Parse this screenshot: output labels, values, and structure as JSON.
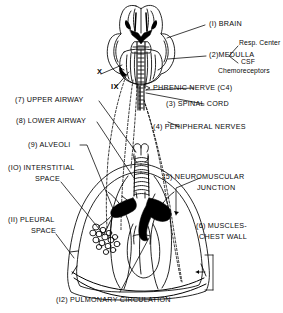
{
  "figure": {
    "ink_color": "#000000",
    "paper_color": "#ffffff"
  },
  "labels": {
    "brain": "(I) BRAIN",
    "medulla": "(2)MEDULLA",
    "resp_center": "Resp. Center",
    "csf_chemoreceptors_l1": "CSF",
    "csf_chemoreceptors_l2": "Chemoreceptors",
    "phrenic_nerve": "PHRENIC NERVE (C4)",
    "spinal_cord": "(3) SPINAL CORD",
    "peripheral_nerves": "(4) PERIPHERAL NERVES",
    "neuromuscular_l1": "(5) NEUROMUSCULAR",
    "neuromuscular_l2": "JUNCTION",
    "muscles_l1": "(6) MUSCLES-",
    "muscles_l2": "CHEST WALL",
    "upper_airway": "(7) UPPER AIRWAY",
    "lower_airway": "(8) LOWER AIRWAY",
    "alveoli": "(9) ALVEOLI",
    "interstitial_l1": "(IO) INTERSTITIAL",
    "interstitial_l2": "SPACE",
    "pleural_l1": "(II) PLEURAL",
    "pleural_l2": "SPACE",
    "pulmonary_circulation": "(I2) PULMONARY CIRCULATION",
    "cranial_nerve_x": "X",
    "cranial_nerve_ix": "IX"
  }
}
